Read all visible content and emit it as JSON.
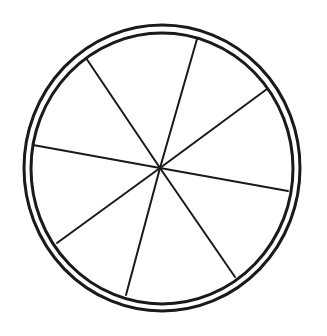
{
  "canvas": {
    "width": 327,
    "height": 336,
    "background": "#ffffff"
  },
  "diagram": {
    "type": "segmented-circle",
    "stroke_color": "#1a1a1a",
    "center": {
      "x": 160,
      "y": 168
    },
    "outer_ring": {
      "cx": 162,
      "cy": 168,
      "rx": 138,
      "ry": 143,
      "stroke_width": 3
    },
    "inner_ring": {
      "cx": 162,
      "cy": 168.5,
      "rx": 131,
      "ry": 135.5,
      "stroke_width": 3
    },
    "spoke_stroke_width": 2,
    "segment_count": 8,
    "spokes": [
      {
        "x": 86,
        "y": 58
      },
      {
        "x": 197,
        "y": 39
      },
      {
        "x": 267,
        "y": 89
      },
      {
        "x": 288,
        "y": 191
      },
      {
        "x": 235,
        "y": 277
      },
      {
        "x": 126,
        "y": 295
      },
      {
        "x": 57,
        "y": 243
      },
      {
        "x": 33,
        "y": 145
      }
    ]
  }
}
